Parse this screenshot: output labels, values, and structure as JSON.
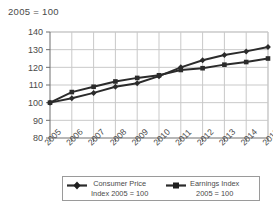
{
  "chart_data": {
    "type": "line",
    "title": "2005 = 100",
    "xlabel": "",
    "ylabel": "",
    "ylim": [
      80,
      140
    ],
    "yticks": [
      80,
      90,
      100,
      110,
      120,
      130,
      140
    ],
    "grid": true,
    "legend_position": "bottom",
    "categories": [
      "2005",
      "2006",
      "2007",
      "2008",
      "2009",
      "2010",
      "2011",
      "2012",
      "2013",
      "2014",
      "2015"
    ],
    "series": [
      {
        "name": "Consumer Price Index 2005 = 100",
        "marker": "diamond",
        "color": "#2b2b2b",
        "values": [
          100.0,
          102.5,
          105.5,
          109.0,
          111.0,
          115.0,
          120.0,
          124.0,
          127.0,
          129.0,
          131.5
        ]
      },
      {
        "name": "Earnings Index 2005 = 100",
        "marker": "square",
        "color": "#2b2b2b",
        "values": [
          100.0,
          106.0,
          109.0,
          112.0,
          114.0,
          115.5,
          118.5,
          119.5,
          121.5,
          123.0,
          125.0
        ]
      }
    ],
    "annotations": []
  },
  "legend": {
    "entries": [
      {
        "line1": "Consumer Price",
        "line2": "Index 2005 = 100",
        "marker": "diamond"
      },
      {
        "line1": "Earnings Index",
        "line2": "2005 = 100",
        "marker": "square"
      }
    ]
  },
  "colors": {
    "axis": "#6e6e6e",
    "grid": "#c9c9c9",
    "series": "#2b2b2b",
    "text": "#4a4a4a",
    "background": "#ffffff",
    "legend_border": "#9a9a9a"
  }
}
